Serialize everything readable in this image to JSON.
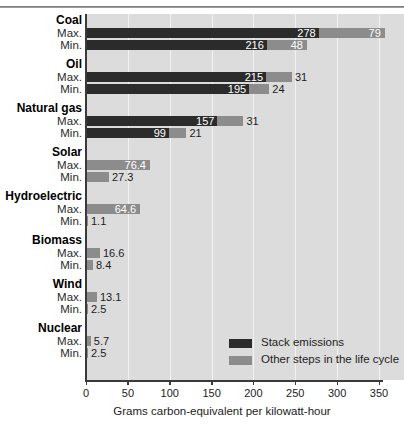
{
  "chart_data": {
    "type": "bar",
    "orientation": "horizontal",
    "stacked": true,
    "title": "",
    "xlabel": "Grams carbon-equivalent per kilowatt-hour",
    "ylabel": "",
    "xlim": [
      0,
      376
    ],
    "xticks": [
      0,
      50,
      100,
      150,
      200,
      250,
      300,
      350
    ],
    "xticklabels": [
      "0",
      "50",
      "100",
      "150",
      "200",
      "250",
      "300",
      "350"
    ],
    "grid": "vertical",
    "legend_position": "inside-lower-right",
    "series": [
      {
        "name": "Stack emissions",
        "color": "#2b2b2b"
      },
      {
        "name": "Other steps in the life cycle",
        "color": "#8c8c8c"
      }
    ],
    "groups": [
      {
        "category": "Coal",
        "rows": [
          {
            "label": "Max.",
            "stack": 278,
            "other": 79,
            "total": 357
          },
          {
            "label": "Min.",
            "stack": 216,
            "other": 48,
            "total": 264
          }
        ]
      },
      {
        "category": "Oil",
        "rows": [
          {
            "label": "Max.",
            "stack": 215,
            "other": 31,
            "total": 246
          },
          {
            "label": "Min.",
            "stack": 195,
            "other": 24,
            "total": 219
          }
        ]
      },
      {
        "category": "Natural gas",
        "rows": [
          {
            "label": "Max.",
            "stack": 157,
            "other": 31,
            "total": 188
          },
          {
            "label": "Min.",
            "stack": 99,
            "other": 21,
            "total": 120
          }
        ]
      },
      {
        "category": "Solar",
        "rows": [
          {
            "label": "Max.",
            "stack": 0,
            "other": 76.4,
            "total": 76.4
          },
          {
            "label": "Min.",
            "stack": 0,
            "other": 27.3,
            "total": 27.3
          }
        ]
      },
      {
        "category": "Hydroelectric",
        "rows": [
          {
            "label": "Max.",
            "stack": 0,
            "other": 64.6,
            "total": 64.6
          },
          {
            "label": "Min.",
            "stack": 0,
            "other": 1.1,
            "total": 1.1
          }
        ]
      },
      {
        "category": "Biomass",
        "rows": [
          {
            "label": "Max.",
            "stack": 0,
            "other": 16.6,
            "total": 16.6
          },
          {
            "label": "Min.",
            "stack": 0,
            "other": 8.4,
            "total": 8.4
          }
        ]
      },
      {
        "category": "Wind",
        "rows": [
          {
            "label": "Max.",
            "stack": 0,
            "other": 13.1,
            "total": 13.1
          },
          {
            "label": "Min.",
            "stack": 0,
            "other": 2.5,
            "total": 2.5
          }
        ]
      },
      {
        "category": "Nuclear",
        "rows": [
          {
            "label": "Max.",
            "stack": 0,
            "other": 5.7,
            "total": 5.7
          },
          {
            "label": "Min.",
            "stack": 0,
            "other": 2.5,
            "total": 2.5
          }
        ]
      }
    ]
  }
}
